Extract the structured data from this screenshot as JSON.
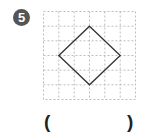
{
  "problem": {
    "number": "5",
    "badge_color": "#555555"
  },
  "figure": {
    "grid": {
      "cols": 6,
      "rows": 6,
      "line_color": "#bbbbbb",
      "style": "dashed"
    },
    "shape": {
      "type": "square rotated 45° (diamond)",
      "stroke_color": "#333333",
      "vertices_grid": [
        [
          3,
          1
        ],
        [
          5,
          3
        ],
        [
          3,
          5
        ],
        [
          1,
          3
        ]
      ]
    }
  },
  "answer": {
    "open_paren": "(",
    "close_paren": ")",
    "value": ""
  }
}
